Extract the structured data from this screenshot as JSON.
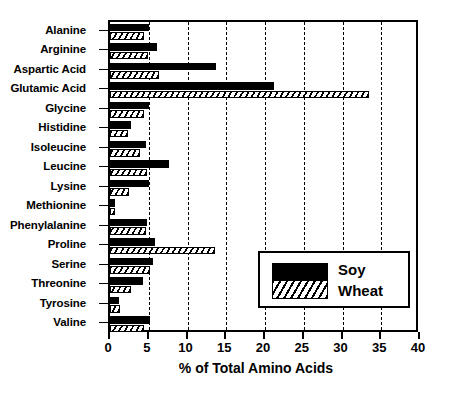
{
  "chart_data": {
    "type": "bar",
    "orientation": "horizontal",
    "title": "",
    "xlabel": "% of Total Amino Acids",
    "ylabel": "",
    "xlim": [
      0,
      40
    ],
    "xticks": [
      0,
      5,
      10,
      15,
      20,
      25,
      30,
      35,
      40
    ],
    "xticklabels": [
      "0",
      "5",
      "10",
      "15",
      "20",
      "25",
      "30",
      "35",
      "40"
    ],
    "grid": "vertical-dashed",
    "legend_position": "inside-right-lower",
    "categories": [
      "Alanine",
      "Arginine",
      "Aspartic Acid",
      "Glutamic Acid",
      "Glycine",
      "Histidine",
      "Isoleucine",
      "Leucine",
      "Lysine",
      "Methionine",
      "Phenylalanine",
      "Proline",
      "Serine",
      "Threonine",
      "Tyrosine",
      "Valine"
    ],
    "series": [
      {
        "name": "Soy",
        "fill": "solid-black",
        "color": "#000000",
        "values": [
          5.0,
          6.1,
          13.7,
          21.2,
          5.0,
          2.7,
          4.6,
          7.6,
          5.0,
          0.7,
          4.8,
          5.8,
          5.5,
          4.2,
          1.1,
          5.1
        ]
      },
      {
        "name": "Wheat",
        "fill": "diagonal-hatch",
        "color": "#000000",
        "values": [
          4.4,
          4.9,
          6.3,
          33.4,
          4.4,
          2.3,
          3.9,
          4.8,
          2.5,
          0.6,
          4.6,
          13.5,
          5.1,
          2.7,
          1.3,
          4.4
        ]
      }
    ]
  },
  "legend": {
    "items": [
      {
        "label": "Soy"
      },
      {
        "label": "Wheat"
      }
    ]
  }
}
